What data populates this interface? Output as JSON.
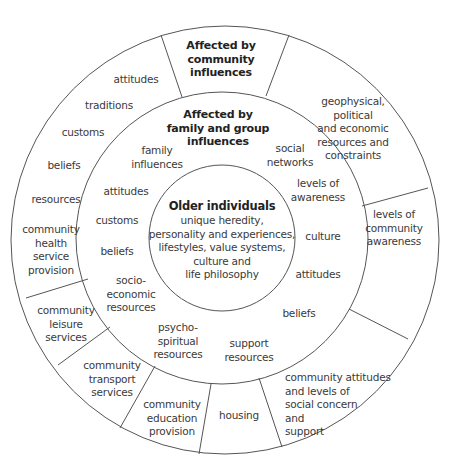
{
  "diagram": {
    "type": "concentric-circles",
    "colors": {
      "line": "#555555",
      "text": "#3a3a3a",
      "background": "#ffffff"
    }
  },
  "center": {
    "title": "Older individuals",
    "text": "unique heredity,\npersonality and experiences,\nlifestyles, value systems,\nculture and\nlife philosophy"
  },
  "middle_ring": {
    "title": "Affected by\nfamily and group\ninfluences",
    "items": [
      "family\ninfluences",
      "social\nnetworks",
      "levels of\nawareness",
      "culture",
      "attitudes",
      "beliefs",
      "support\nresources",
      "psycho-\nspiritual\nresources",
      "socio-\neconomic\nresources",
      "beliefs",
      "customs",
      "attitudes"
    ]
  },
  "outer_ring": {
    "title": "Affected by\ncommunity\ninfluences",
    "segments": [
      "geophysical,\npolitical\nand economic\nresources and\nconstraints",
      "levels of\ncommunity\nawareness",
      "community attitudes\nand levels of\nsocial concern\nand\nsupport",
      "housing",
      "community\neducation\nprovision",
      "community\ntransport\nservices",
      "community\nleisure\nservices",
      "community\nhealth\nservice\nprovision",
      "attitudes\n\ntraditions\n\ncustoms\n\nbeliefs\n\nresources"
    ],
    "left_list": [
      "attitudes",
      "traditions",
      "customs",
      "beliefs",
      "resources"
    ]
  }
}
